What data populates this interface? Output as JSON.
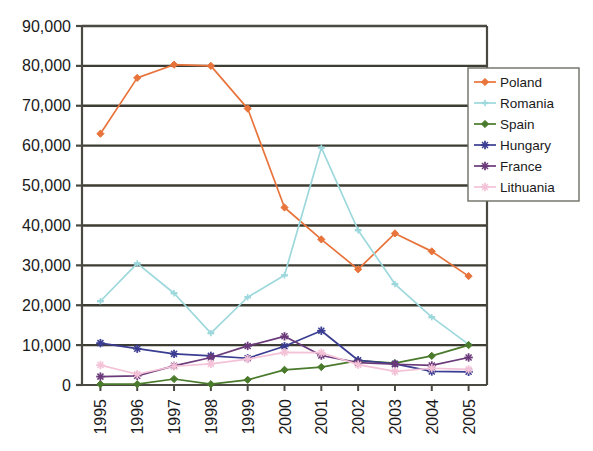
{
  "chart_data": {
    "type": "line",
    "title": "",
    "xlabel": "",
    "ylabel": "",
    "categories": [
      "1995",
      "1996",
      "1997",
      "1998",
      "1999",
      "2000",
      "2001",
      "2002",
      "2003",
      "2004",
      "2005"
    ],
    "ylim": [
      0,
      90000
    ],
    "ytick_values": [
      0,
      10000,
      20000,
      30000,
      40000,
      50000,
      60000,
      70000,
      80000,
      90000
    ],
    "ytick_labels": [
      "0",
      "10,000",
      "20,000",
      "30,000",
      "40,000",
      "50,000",
      "60,000",
      "70,000",
      "80,000",
      "90,000"
    ],
    "grid": "horizontal",
    "legend_position": "top-right",
    "series": [
      {
        "name": "Poland",
        "color": "#E8743B",
        "marker": "diamond",
        "values": [
          63000,
          77000,
          80300,
          80000,
          69300,
          44500,
          36500,
          29000,
          38000,
          33500,
          27300
        ]
      },
      {
        "name": "Romania",
        "color": "#9DD8DC",
        "marker": "dash",
        "values": [
          21000,
          30500,
          23000,
          13000,
          22000,
          27500,
          59500,
          38800,
          25300,
          17000,
          10200
        ]
      },
      {
        "name": "Spain",
        "color": "#4A7A2B",
        "marker": "diamond",
        "values": [
          200,
          200,
          1500,
          200,
          1300,
          3800,
          4500,
          6100,
          5500,
          7300,
          10000
        ]
      },
      {
        "name": "Hungary",
        "color": "#3A3D91",
        "marker": "star",
        "values": [
          10500,
          9100,
          7800,
          7300,
          6700,
          9700,
          13600,
          6200,
          5300,
          3400,
          3300
        ]
      },
      {
        "name": "France",
        "color": "#6B3A7A",
        "marker": "star",
        "values": [
          2100,
          2300,
          4800,
          6900,
          9800,
          12200,
          7400,
          5600,
          5200,
          4900,
          6900
        ]
      },
      {
        "name": "Lithuania",
        "color": "#F4C2D7",
        "marker": "star",
        "values": [
          5000,
          2700,
          4700,
          5300,
          6500,
          8200,
          8100,
          5100,
          3400,
          4200,
          3900
        ]
      }
    ]
  },
  "legend": {
    "entries": [
      {
        "label": "Poland"
      },
      {
        "label": "Romania"
      },
      {
        "label": "Spain"
      },
      {
        "label": "Hungary"
      },
      {
        "label": "France"
      },
      {
        "label": "Lithuania"
      }
    ]
  }
}
